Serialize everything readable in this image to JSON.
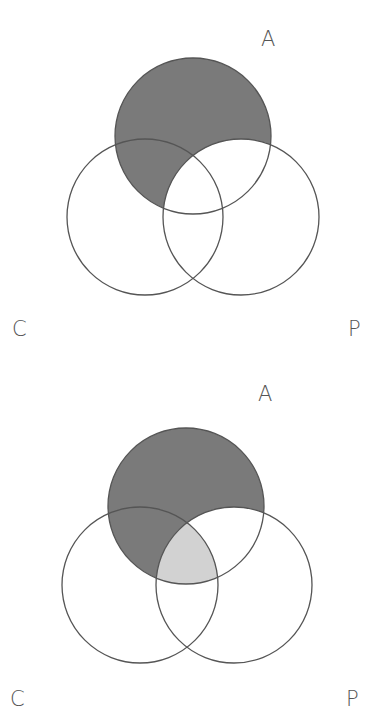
{
  "clipped_heading": "",
  "colors": {
    "dark_fill": "#7a7a7a",
    "light_fill": "#d2d2d2",
    "stroke": "#555555",
    "label": "#555555"
  },
  "diagrams": [
    {
      "name": "diagram-1",
      "description": "A minus P shaded",
      "labels": {
        "A": "A",
        "C": "C",
        "P": "P"
      },
      "shaded_regions": [
        {
          "region": "A ∖ P",
          "shade": "dark"
        }
      ]
    },
    {
      "name": "diagram-2",
      "description": "A minus P shaded dark; A ∩ C ∩ P shaded light",
      "labels": {
        "A": "A",
        "C": "C",
        "P": "P"
      },
      "shaded_regions": [
        {
          "region": "A ∖ P",
          "shade": "dark"
        },
        {
          "region": "A ∩ C ∩ P",
          "shade": "light"
        }
      ]
    }
  ]
}
